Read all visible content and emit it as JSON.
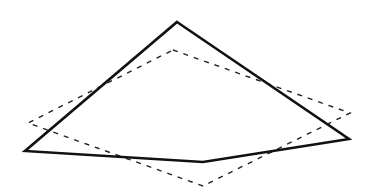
{
  "diagram": {
    "width": 374,
    "height": 188,
    "background": "#ffffff",
    "shapes": [
      {
        "id": "solid-quadrilateral",
        "style": "solid",
        "stroke": "#111111",
        "stroke_width": 2.6,
        "points": [
          [
            177,
            22
          ],
          [
            349,
            139
          ],
          [
            203,
            162
          ],
          [
            25,
            151
          ]
        ]
      },
      {
        "id": "dashed-quadrilateral",
        "style": "dashed",
        "stroke": "#222222",
        "stroke_width": 1.4,
        "dasharray": "5,6",
        "points": [
          [
            173,
            50
          ],
          [
            350,
            113
          ],
          [
            203,
            186
          ],
          [
            28,
            123
          ]
        ]
      }
    ]
  }
}
